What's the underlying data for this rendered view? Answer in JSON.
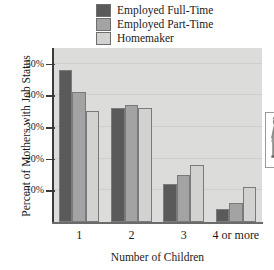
{
  "chart_data": {
    "type": "bar",
    "title": "",
    "xlabel": "Number of Children",
    "ylabel": "Percent of Mothers with Job Status",
    "categories": [
      "1",
      "2",
      "3",
      "4 or more"
    ],
    "series": [
      {
        "name": "Employed Full-Time",
        "color": "#5a5a5a",
        "values": [
          48,
          36,
          12,
          4
        ]
      },
      {
        "name": "Employed Part-Time",
        "color": "#a3a3a3",
        "values": [
          41,
          37,
          15,
          6
        ]
      },
      {
        "name": "Homemaker",
        "color": "#d2d2d0",
        "values": [
          35,
          36,
          18,
          11
        ]
      }
    ],
    "ylim": [
      0,
      55
    ],
    "yticks": [
      10,
      20,
      30,
      40,
      50
    ],
    "ytick_labels": [
      "10%",
      "20%",
      "30%",
      "40%",
      "50%"
    ],
    "grid": true,
    "legend_position": "top-center",
    "plot_background": "#dcdcda"
  },
  "legend": {
    "items": [
      {
        "label": "Employed Full-Time"
      },
      {
        "label": "Employed Part-Time"
      },
      {
        "label": "Homemaker"
      }
    ]
  },
  "inset": {
    "name": "mother-and-child-illustration"
  }
}
